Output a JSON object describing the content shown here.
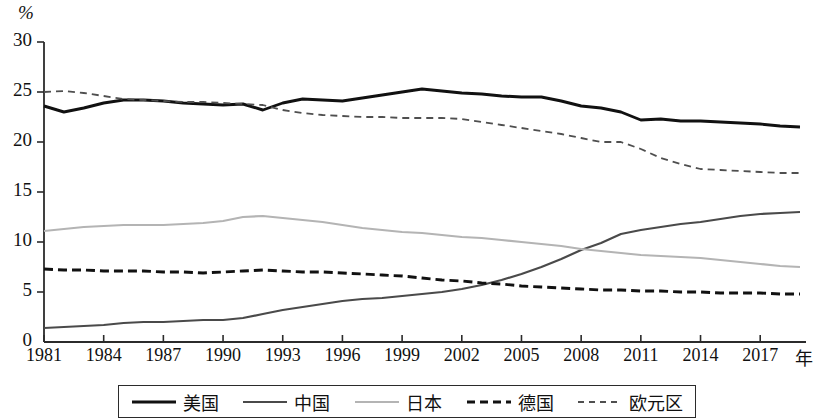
{
  "chart_data": {
    "type": "line",
    "title": "",
    "subtitle": "",
    "xlabel": "年",
    "ylabel": "%",
    "xlim": [
      1981,
      2019
    ],
    "ylim": [
      0,
      30
    ],
    "ytick_values": [
      0,
      5,
      10,
      15,
      20,
      25,
      30
    ],
    "yticks": [
      "0",
      "5",
      "10",
      "15",
      "20",
      "25",
      "30"
    ],
    "xtick_values": [
      1981,
      1984,
      1987,
      1990,
      1993,
      1996,
      1999,
      2002,
      2005,
      2008,
      2011,
      2014,
      2017
    ],
    "xticks": [
      "1981",
      "1984",
      "1987",
      "1990",
      "1993",
      "1996",
      "1999",
      "2002",
      "2005",
      "2008",
      "2011",
      "2014",
      "2017"
    ],
    "grid": false,
    "legend_position": "bottom",
    "x": [
      1981,
      1982,
      1983,
      1984,
      1985,
      1986,
      1987,
      1988,
      1989,
      1990,
      1991,
      1992,
      1993,
      1994,
      1995,
      1996,
      1997,
      1998,
      1999,
      2000,
      2001,
      2002,
      2003,
      2004,
      2005,
      2006,
      2007,
      2008,
      2009,
      2010,
      2011,
      2012,
      2013,
      2014,
      2015,
      2016,
      2017,
      2018,
      2019
    ],
    "series": [
      {
        "name": "美国",
        "color": "#111111",
        "style": "solid",
        "width": 2.9,
        "values": [
          23.6,
          23.0,
          23.4,
          23.9,
          24.2,
          24.2,
          24.1,
          23.9,
          23.8,
          23.7,
          23.8,
          23.2,
          23.9,
          24.3,
          24.2,
          24.1,
          24.4,
          24.7,
          25.0,
          25.3,
          25.1,
          24.9,
          24.8,
          24.6,
          24.5,
          24.5,
          24.1,
          23.6,
          23.4,
          23.0,
          22.2,
          22.3,
          22.1,
          22.1,
          22.0,
          21.9,
          21.8,
          21.6,
          21.5
        ]
      },
      {
        "name": "中国",
        "color": "#4a4a4a",
        "style": "solid",
        "width": 2.2,
        "values": [
          1.4,
          1.5,
          1.6,
          1.7,
          1.9,
          2.0,
          2.0,
          2.1,
          2.2,
          2.2,
          2.4,
          2.8,
          3.2,
          3.5,
          3.8,
          4.1,
          4.3,
          4.4,
          4.6,
          4.8,
          5.0,
          5.3,
          5.7,
          6.2,
          6.8,
          7.5,
          8.3,
          9.2,
          9.9,
          10.8,
          11.2,
          11.5,
          11.8,
          12.0,
          12.3,
          12.6,
          12.8,
          12.9,
          13.0
        ]
      },
      {
        "name": "日本",
        "color": "#b4b4b4",
        "style": "solid",
        "width": 2.2,
        "values": [
          11.1,
          11.3,
          11.5,
          11.6,
          11.7,
          11.7,
          11.7,
          11.8,
          11.9,
          12.1,
          12.5,
          12.6,
          12.4,
          12.2,
          12.0,
          11.7,
          11.4,
          11.2,
          11.0,
          10.9,
          10.7,
          10.5,
          10.4,
          10.2,
          10.0,
          9.8,
          9.6,
          9.3,
          9.1,
          8.9,
          8.7,
          8.6,
          8.5,
          8.4,
          8.2,
          8.0,
          7.8,
          7.6,
          7.5
        ]
      },
      {
        "name": "德国",
        "color": "#111111",
        "style": "dashed",
        "width": 2.9,
        "values": [
          7.3,
          7.2,
          7.2,
          7.1,
          7.1,
          7.1,
          7.0,
          7.0,
          6.9,
          7.0,
          7.1,
          7.2,
          7.1,
          7.0,
          7.0,
          6.9,
          6.8,
          6.7,
          6.6,
          6.4,
          6.2,
          6.1,
          5.9,
          5.8,
          5.6,
          5.5,
          5.4,
          5.3,
          5.2,
          5.2,
          5.1,
          5.1,
          5.0,
          5.0,
          4.9,
          4.9,
          4.9,
          4.8,
          4.8
        ]
      },
      {
        "name": "欧元区",
        "color": "#4f4f4f",
        "style": "dashed",
        "width": 1.8,
        "values": [
          25.0,
          25.1,
          24.9,
          24.6,
          24.3,
          24.2,
          24.1,
          24.0,
          24.0,
          23.9,
          23.8,
          23.7,
          23.2,
          22.9,
          22.7,
          22.6,
          22.5,
          22.5,
          22.4,
          22.4,
          22.4,
          22.3,
          22.0,
          21.7,
          21.4,
          21.1,
          20.8,
          20.4,
          20.0,
          20.0,
          19.3,
          18.4,
          17.8,
          17.3,
          17.2,
          17.1,
          17.0,
          16.9,
          16.9
        ]
      }
    ]
  },
  "legend": {
    "items": [
      {
        "label": "美国"
      },
      {
        "label": "中国"
      },
      {
        "label": "日本"
      },
      {
        "label": "德国"
      },
      {
        "label": "欧元区"
      }
    ]
  }
}
